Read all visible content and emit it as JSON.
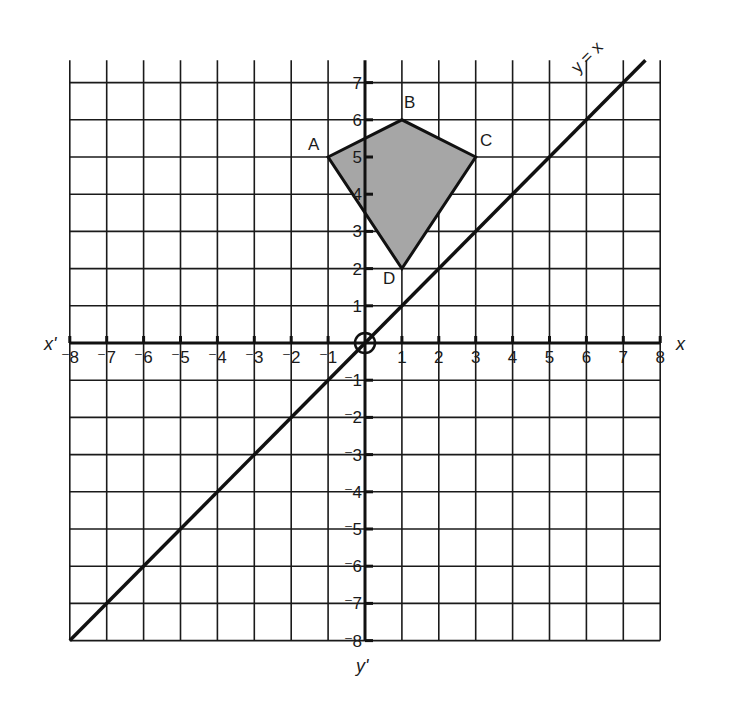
{
  "chart_data": {
    "type": "scatter",
    "title": "",
    "xlabel": "x",
    "xlabel_neg": "x'",
    "ylabel": "y",
    "ylabel_neg": "y'",
    "xlim": [
      -8,
      8
    ],
    "ylim": [
      -8,
      7.6
    ],
    "grid": true,
    "x_ticks": [
      -8,
      -7,
      -6,
      -5,
      -4,
      -3,
      -2,
      -1,
      1,
      2,
      3,
      4,
      5,
      6,
      7,
      8
    ],
    "y_ticks": [
      -8,
      -7,
      -6,
      -5,
      -4,
      -3,
      -2,
      -1,
      1,
      2,
      3,
      4,
      5,
      6,
      7
    ],
    "x_tick_labels": [
      "⁻8",
      "⁻7",
      "⁻6",
      "⁻5",
      "⁻4",
      "⁻3",
      "⁻2",
      "⁻1",
      "1",
      "2",
      "3",
      "4",
      "5",
      "6",
      "7",
      "8"
    ],
    "y_tick_labels": [
      "⁻8",
      "⁻7",
      "⁻6",
      "⁻5",
      "⁻4",
      "⁻3",
      "⁻2",
      "⁻1",
      "1",
      "2",
      "3",
      "4",
      "5",
      "6",
      "7"
    ],
    "origin_marker": "circle",
    "shape": {
      "name": "quadrilateral ABCD (kite)",
      "fill": "#a6a6a6",
      "vertices": [
        {
          "label": "A",
          "x": -1,
          "y": 5
        },
        {
          "label": "B",
          "x": 1,
          "y": 6
        },
        {
          "label": "C",
          "x": 3,
          "y": 5
        },
        {
          "label": "D",
          "x": 1,
          "y": 2
        }
      ]
    },
    "lines": [
      {
        "label": "y = x",
        "from": [
          -8,
          -8
        ],
        "to": [
          7.6,
          7.6
        ]
      }
    ]
  },
  "labels": {
    "x_axis": "x",
    "x_axis_neg": "x'",
    "y_axis_neg": "y'",
    "line": "y = x",
    "A": "A",
    "B": "B",
    "C": "C",
    "D": "D"
  }
}
